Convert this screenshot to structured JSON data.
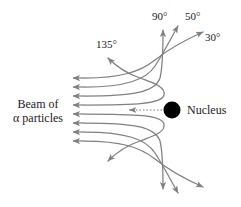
{
  "figure": {
    "type": "physics-diagram",
    "background_color": "#ffffff",
    "trajectory_color": "#808080",
    "text_color": "#1a1a1a",
    "nucleus_color": "#000000"
  },
  "labels": {
    "beam_line1": "Beam of",
    "beam_line2": "α particles",
    "nucleus": "Nucleus",
    "angle_135": "135°",
    "angle_90": "90°",
    "angle_50": "50°",
    "angle_30": "30°"
  },
  "scattering_angles": [
    {
      "value": 135,
      "label": "135°"
    },
    {
      "value": 90,
      "label": "90°"
    },
    {
      "value": 50,
      "label": "50°"
    },
    {
      "value": 30,
      "label": "30°"
    }
  ],
  "beam": {
    "incoming_ray_count": 8,
    "direction": "left-to-right",
    "arrowhead_side": "left"
  },
  "nucleus": {
    "center_x": 172,
    "center_y": 110,
    "radius": 8,
    "pointer_style": "dotted-arrow",
    "pointer_direction": "left"
  }
}
